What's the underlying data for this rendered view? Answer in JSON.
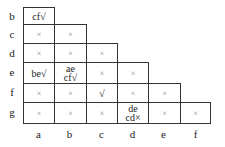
{
  "row_labels": [
    "b",
    "c",
    "d",
    "e",
    "f",
    "g"
  ],
  "col_labels": [
    "a",
    "b",
    "c",
    "d",
    "e",
    "f"
  ],
  "cells": {
    "b_a": "cf√",
    "c_a": "×",
    "c_b": "×",
    "d_a": "×",
    "d_b": "×",
    "d_c": "×",
    "e_a": "be√",
    "e_b_1": "ae",
    "e_b_2": "cf√",
    "e_c": "×",
    "e_d": "×",
    "f_a": "×",
    "f_b": "×",
    "f_c": "√",
    "f_d": "×",
    "f_e": "×",
    "g_a": "×",
    "g_b": "×",
    "g_c": "×",
    "g_d_1": "de",
    "g_d_2": "cd×",
    "g_e": "×",
    "g_f": "×"
  }
}
